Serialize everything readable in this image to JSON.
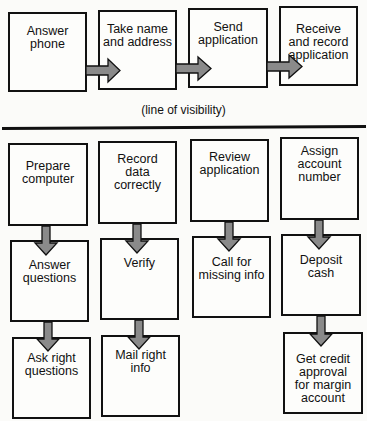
{
  "diagram": {
    "type": "service blueprint",
    "visibility_label": "(line of visibility)",
    "colors": {
      "arrow_fill": "#8a8a8a",
      "outline": "#111111",
      "background": "#fbfbf9"
    },
    "front_stage": [
      {
        "id": "b1",
        "label": "Answer\nphone"
      },
      {
        "id": "b2",
        "label": "Take name\nand address"
      },
      {
        "id": "b3",
        "label": "Send\napplication"
      },
      {
        "id": "b4",
        "label": "Receive\nand record\napplication"
      }
    ],
    "back_stage": {
      "columns": [
        [
          {
            "label": "Prepare\ncomputer"
          },
          {
            "label": "Answer\nquestions"
          },
          {
            "label": "Ask right\nquestions"
          }
        ],
        [
          {
            "label": "Record\ndata correctly"
          },
          {
            "label": "Verify"
          },
          {
            "label": "Mail right\ninfo"
          }
        ],
        [
          {
            "label": "Review\napplication"
          },
          {
            "label": "Call for\nmissing info"
          }
        ],
        [
          {
            "label": "Assign\naccount\nnumber"
          },
          {
            "label": "Deposit\ncash"
          },
          {
            "label": "Get credit\napproval\nfor margin\naccount"
          }
        ]
      ]
    },
    "edges": [
      [
        "Answer phone",
        "Take name and address"
      ],
      [
        "Take name and address",
        "Send application"
      ],
      [
        "Send application",
        "Receive and record application"
      ],
      [
        "Prepare computer",
        "Answer questions"
      ],
      [
        "Answer questions",
        "Ask right questions"
      ],
      [
        "Record data correctly",
        "Verify"
      ],
      [
        "Verify",
        "Mail right info"
      ],
      [
        "Review application",
        "Call for missing info"
      ],
      [
        "Assign account number",
        "Deposit cash"
      ],
      [
        "Deposit cash",
        "Get credit approval for margin account"
      ]
    ]
  }
}
